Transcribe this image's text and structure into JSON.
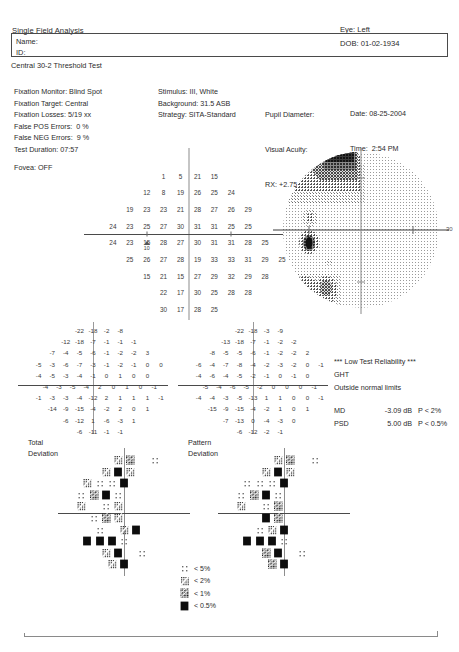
{
  "header": {
    "title": "Single Field Analysis",
    "eye": "Eye: Left",
    "dob": "DOB: 01-02-1934",
    "name_label": "Name:",
    "id_label": "ID:",
    "test_type": "Central 30-2 Threshold Test"
  },
  "params": {
    "left": "Fixation Monitor: Blind Spot\nFixation Target: Central\nFixation Losses: 5/19 xx\nFalse POS Errors:  0 %\nFalse NEG Errors:  9 %\nTest Duration: 07:57",
    "fovea": "Fovea: OFF",
    "middle": "Stimulus: III, White\nBackground: 31.5 ASB\nStrategy: SITA-Standard",
    "pupil_label": "Pupil Diameter:",
    "acuity_label": "Visual Acuity:",
    "rx_label": "RX: +2.75 DS",
    "rx_dc": "DC  X",
    "date": "Date: 08-25-2004",
    "time": "Time:  2:54 PM",
    "age": "Age: 70"
  },
  "reliability": {
    "warning": "*** Low Test Reliability ***",
    "ght_label": "GHT",
    "ght_value": "Outside normal limits"
  },
  "indices": [
    {
      "key": "MD",
      "value": "-3.09 dB",
      "p": "P < 2%"
    },
    {
      "key": "PSD",
      "value": "5.00 dB",
      "p": "P < 0.5%"
    }
  ],
  "plot_labels": {
    "total_deviation": "Total\nDeviation",
    "pattern_deviation": "Pattern\nDeviation",
    "degree_mark": "30"
  },
  "legend": [
    {
      "symbol": "p5",
      "label": "< 5%"
    },
    {
      "symbol": "p2",
      "label": "< 2%"
    },
    {
      "symbol": "p1",
      "label": "< 1%"
    },
    {
      "symbol": "p05",
      "label": "< 0.5%"
    }
  ],
  "chart_data": {
    "type": "heatmap",
    "units": "dB",
    "grid_spacing_degrees": 6,
    "threshold_sensitivity": {
      "description": "Numeric threshold sensitivities in dB, 30-2 pattern, 8 rows",
      "rows": [
        {
          "y": 21,
          "x_start": -9,
          "values": [
            1,
            5,
            21,
            15
          ]
        },
        {
          "y": 15,
          "x_start": -15,
          "values": [
            12,
            8,
            19,
            26,
            25,
            24
          ]
        },
        {
          "y": 9,
          "x_start": -21,
          "values": [
            19,
            23,
            23,
            21,
            28,
            27,
            26,
            29
          ]
        },
        {
          "y": 3,
          "x_start": -27,
          "values": [
            24,
            23,
            25,
            27,
            30,
            31,
            31,
            25,
            25
          ]
        },
        {
          "y": -3,
          "x_start": -27,
          "values": [
            24,
            23,
            15,
            28,
            27,
            30,
            31,
            31,
            28,
            25
          ]
        },
        {
          "y": -9,
          "x_start": -21,
          "values": [
            25,
            26,
            27,
            28,
            19,
            33,
            33,
            31,
            29,
            25
          ]
        },
        {
          "y": -15,
          "x_start": -15,
          "values": [
            15,
            21,
            15,
            27,
            29,
            32,
            29,
            28
          ]
        },
        {
          "y": -21,
          "x_start": -9,
          "values": [
            22,
            17,
            30,
            25,
            28,
            28
          ]
        },
        {
          "y": -27,
          "x_start": -9,
          "values": [
            30,
            17,
            28,
            25
          ]
        }
      ],
      "blind_spot_retest": {
        "upper": "15",
        "lower": "10",
        "x": -15,
        "y": -3
      }
    },
    "total_deviation": {
      "description": "Total deviation values in dB",
      "rows": [
        [
          -22,
          -18,
          -2,
          -8
        ],
        [
          -12,
          -18,
          -7,
          -1,
          -1,
          -1
        ],
        [
          -7,
          -4,
          -5,
          -6,
          -1,
          -2,
          -2,
          3
        ],
        [
          -5,
          -3,
          -6,
          -7,
          -3,
          -1,
          -2,
          -1,
          0,
          0
        ],
        [
          -4,
          -5,
          -3,
          -4,
          -1,
          0,
          1,
          0,
          0
        ],
        [
          -4,
          -3,
          -5,
          -4,
          2,
          0,
          1,
          0,
          -1
        ],
        [
          -1,
          -3,
          -3,
          -4,
          -12,
          2,
          1,
          1,
          1,
          -1
        ],
        [
          -14,
          -9,
          -15,
          -4,
          -2,
          2,
          0,
          1
        ],
        [
          -6,
          -12,
          1,
          -6,
          -3,
          1
        ],
        [
          -6,
          -11,
          -1,
          -1
        ]
      ]
    },
    "pattern_deviation": {
      "description": "Pattern deviation values in dB",
      "rows": [
        [
          -22,
          -18,
          -3,
          -9
        ],
        [
          -13,
          -18,
          -7,
          -1,
          -2,
          -2
        ],
        [
          -8,
          -5,
          -5,
          -6,
          -1,
          -2,
          -2,
          2
        ],
        [
          -6,
          -4,
          -7,
          -8,
          -4,
          -2,
          -3,
          -2,
          0,
          -1
        ],
        [
          -4,
          -6,
          -4,
          -5,
          -2,
          -1,
          0,
          -1,
          0
        ],
        [
          -5,
          -4,
          -6,
          -5,
          -2,
          0,
          0,
          0,
          -1
        ],
        [
          -4,
          -4,
          -3,
          -5,
          -13,
          1,
          1,
          0,
          0,
          -1
        ],
        [
          -15,
          -9,
          -15,
          -4,
          -2,
          1,
          0,
          1
        ],
        [
          -7,
          -13,
          0,
          -4,
          -3,
          0
        ],
        [
          -6,
          -12,
          -2,
          -1
        ]
      ]
    },
    "total_deviation_probability": {
      "legend_levels": [
        "p5",
        "p2",
        "p1",
        "p05"
      ],
      "rows": [
        [
          null,
          null,
          "p2",
          "p1",
          null,
          "p5"
        ],
        [
          null,
          "p2",
          "p05",
          "p2",
          null,
          null
        ],
        [
          "p2",
          "p5",
          "p5",
          "p05",
          null,
          null,
          null
        ],
        [
          "p5",
          "p1",
          "p05",
          "p5",
          null,
          null,
          null,
          null
        ],
        [
          "p2",
          null,
          "p5",
          "p2",
          null,
          null,
          null,
          null
        ],
        [
          null,
          "p5",
          "p1",
          "p2",
          null,
          null,
          null,
          null
        ],
        [
          null,
          "p5",
          null,
          "p2",
          "p05",
          null,
          null,
          null
        ],
        [
          "p05",
          "p05",
          "p05",
          "p5",
          null,
          null,
          null
        ],
        [
          null,
          "p2",
          "p05",
          null,
          "p5",
          null
        ],
        [
          null,
          "p2",
          "p05",
          null,
          null
        ]
      ]
    },
    "pattern_deviation_probability": {
      "legend_levels": [
        "p5",
        "p2",
        "p1",
        "p05"
      ],
      "rows": [
        [
          null,
          null,
          "p2",
          "p1",
          null,
          "p5"
        ],
        [
          null,
          "p2",
          "p05",
          "p2",
          null,
          null
        ],
        [
          "p5",
          "p5",
          "p5",
          "p05",
          null,
          null,
          null
        ],
        [
          "p5",
          "p1",
          "p05",
          "p5",
          null,
          null,
          null,
          null
        ],
        [
          "p2",
          null,
          "p5",
          "p1",
          null,
          null,
          null,
          null
        ],
        [
          null,
          null,
          "p05",
          "p1",
          null,
          null,
          null,
          null
        ],
        [
          null,
          "p5",
          "p2",
          "p05",
          null,
          null,
          null
        ],
        [
          "p05",
          "p05",
          "p05",
          "p5",
          null,
          null,
          null
        ],
        [
          null,
          "p1",
          "p05",
          null,
          "p5",
          null
        ],
        [
          null,
          "p1",
          "p05",
          null,
          null
        ]
      ]
    },
    "grayscale_map": {
      "description": "Greyscale sensitivity map, left eye, 30 degree field. Darkest (deepest defect) in superior nasal quadrant; dense absolute scotoma at blind spot region; moderate depression inferior nasal.",
      "radius_degrees": 30,
      "darkest_region": "superior nasal",
      "blind_spot_location": "left of vertical meridian, just below horizontal"
    }
  }
}
